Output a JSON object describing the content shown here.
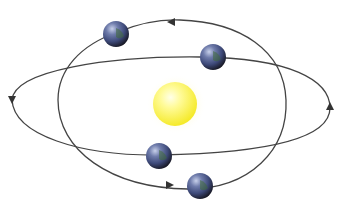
{
  "diagram": {
    "title": "",
    "colors": {
      "background": "#ffffff",
      "orbit": "#444444",
      "sun_core": "#fffb9a",
      "sun_edge": "#f5ea2a",
      "sun_glow": "#fffbd0",
      "planet_light": "#a9b6d8",
      "planet_mid": "#3e4a7a",
      "planet_dark": "#1a1a2a",
      "planet_land": "#3f6a3a"
    },
    "bodies": {
      "sun": {
        "name": "sun"
      },
      "planets": [
        {
          "name": "planet-1",
          "orbit": "tilted-ellipse"
        },
        {
          "name": "planet-2",
          "orbit": "horizontal-ellipse"
        },
        {
          "name": "planet-3",
          "orbit": "horizontal-ellipse"
        },
        {
          "name": "planet-4",
          "orbit": "tilted-ellipse"
        }
      ]
    },
    "orbits": [
      {
        "name": "horizontal-ellipse",
        "direction": "counter-clockwise"
      },
      {
        "name": "tilted-ellipse",
        "direction": "counter-clockwise"
      }
    ]
  }
}
